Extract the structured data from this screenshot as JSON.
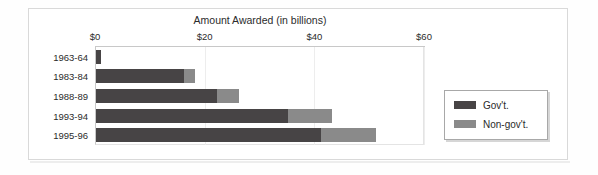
{
  "chart_data": {
    "type": "bar",
    "orientation": "horizontal",
    "stacked": true,
    "title": "Amount Awarded (in billions)",
    "xlabel": "",
    "ylabel": "",
    "xlim": [
      0,
      60
    ],
    "xticks": [
      0,
      20,
      40,
      60
    ],
    "xtick_labels": [
      "$0",
      "$20",
      "$40",
      "$60"
    ],
    "grid": true,
    "axis_position": "top",
    "legend_position": "right",
    "categories": [
      "1963-64",
      "1983-84",
      "1988-89",
      "1993-94",
      "1995-96"
    ],
    "series": [
      {
        "name": "Gov't.",
        "color": "#474445",
        "values": [
          1,
          16,
          22,
          35,
          41
        ]
      },
      {
        "name": "Non-gov't.",
        "color": "#8a8a8a",
        "values": [
          0,
          2,
          4,
          8,
          10
        ]
      }
    ],
    "totals": [
      1,
      18,
      26,
      43,
      51
    ]
  },
  "legend": {
    "entries": [
      {
        "label": "Gov't."
      },
      {
        "label": "Non-gov't."
      }
    ]
  },
  "colors": {
    "gov": "#474445",
    "nongov": "#8a8a8a",
    "axis": "#c8c8c8",
    "grid": "#ededed",
    "frame": "#d9d9d9",
    "text": "#2b2b2b"
  }
}
